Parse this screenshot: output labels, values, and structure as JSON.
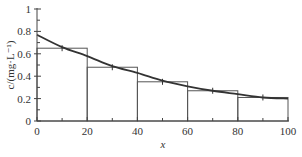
{
  "chart_data": {
    "type": "bar",
    "title": "",
    "xlabel": "x",
    "ylabel": "c/(mg·L⁻¹)",
    "xlim": [
      0,
      100
    ],
    "ylim": [
      0,
      1
    ],
    "x_ticks": [
      "0",
      "20",
      "40",
      "60",
      "80",
      "100"
    ],
    "y_ticks": [
      "0",
      "0.2",
      "0.4",
      "0.6",
      "0.8",
      "1"
    ],
    "grid": false,
    "legend": null,
    "bars": {
      "bin_edges": [
        0,
        20,
        40,
        60,
        80,
        100
      ],
      "values": [
        0.65,
        0.48,
        0.35,
        0.27,
        0.21
      ]
    },
    "curve": {
      "type": "line",
      "x": [
        0,
        10,
        20,
        30,
        40,
        50,
        60,
        70,
        80,
        90,
        100
      ],
      "y": [
        0.77,
        0.66,
        0.58,
        0.49,
        0.43,
        0.36,
        0.31,
        0.27,
        0.24,
        0.21,
        0.2
      ]
    },
    "curve_markers": {
      "x": [
        10,
        30,
        50,
        70,
        90
      ],
      "y": [
        0.65,
        0.48,
        0.35,
        0.27,
        0.21
      ]
    }
  }
}
